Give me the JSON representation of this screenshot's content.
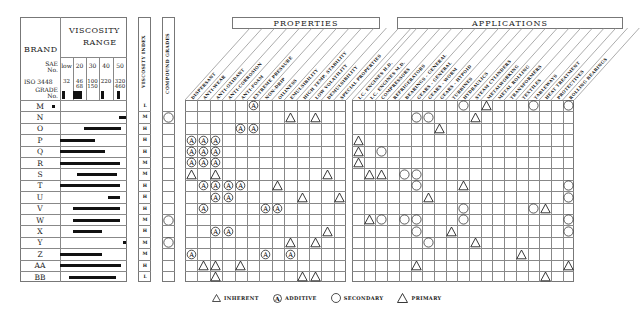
{
  "chart_data": {
    "type": "table",
    "left_panel": {
      "header": {
        "brand": "BRAND",
        "viscosity_range": [
          "VISCOSITY",
          "RANGE"
        ],
        "sae_label": [
          "SAE",
          "No."
        ],
        "iso_label": "ISO 3448",
        "grade_label": [
          "GRADE",
          "No."
        ],
        "sae_grades": [
          "low",
          "20",
          "30",
          "40",
          "50"
        ],
        "iso_grades": [
          "32",
          "46\n68",
          "100\n150",
          "220",
          "320\n460"
        ]
      },
      "viscosity_index_header": "VISCOSITY INDEX",
      "compound_grades_header": "COMPOUND GRADES"
    },
    "brands": [
      {
        "name": "M",
        "bar": [
          52,
          55
        ],
        "vi": "L",
        "compound": false
      },
      {
        "name": "N",
        "bar": [
          119,
          126
        ],
        "vi": "M",
        "compound": true
      },
      {
        "name": "O",
        "bar": [
          84,
          121
        ],
        "vi": "H",
        "compound": false
      },
      {
        "name": "P",
        "bar": [
          60,
          95
        ],
        "vi": "H",
        "compound": false
      },
      {
        "name": "Q",
        "bar": [
          60,
          105
        ],
        "vi": "H",
        "compound": false
      },
      {
        "name": "R",
        "bar": [
          60,
          120
        ],
        "vi": "M",
        "compound": false
      },
      {
        "name": "S",
        "bar": [
          77,
          117
        ],
        "vi": "M",
        "compound": false
      },
      {
        "name": "T",
        "bar": [
          60,
          120
        ],
        "vi": "H",
        "compound": false
      },
      {
        "name": "U",
        "bar": [
          108,
          120
        ],
        "vi": "H",
        "compound": false
      },
      {
        "name": "V",
        "bar": [
          73,
          120
        ],
        "vi": "H",
        "compound": false
      },
      {
        "name": "W",
        "bar": [
          73,
          120
        ],
        "vi": "M",
        "compound": true
      },
      {
        "name": "X",
        "bar": [
          73,
          102
        ],
        "vi": "H",
        "compound": false
      },
      {
        "name": "Y",
        "bar": [
          123,
          126
        ],
        "vi": "M",
        "compound": true
      },
      {
        "name": "Z",
        "bar": [
          60,
          102
        ],
        "vi": "M",
        "compound": false
      },
      {
        "name": "AA",
        "bar": [
          60,
          121
        ],
        "vi": "H",
        "compound": false
      },
      {
        "name": "BB",
        "bar": [
          69,
          116
        ],
        "vi": "L",
        "compound": false
      }
    ],
    "properties_header": "PROPERTIES",
    "properties_columns": [
      "DISPERSANT",
      "ANTI-WEAR",
      "ANTI-OXIDANT",
      "ANTI-CORROSION",
      "ANTI-FOAM",
      "EXTREME PRESSURE",
      "NON-DRIP",
      "OILINESS",
      "EMULSIBILITY",
      "HIGH TEMP. STABILITY",
      "LOW VOLATILITY",
      "DEMULSIBILITY",
      "SPECIAL PROPERTIES"
    ],
    "applications_header": "APPLICATIONS",
    "applications_columns": [
      "I.C. ENGINES H.D.",
      "I.C. ENGINES M.D.",
      "COMPRESSORS",
      "REFRIGERATORS",
      "BEARINGS - GENERAL",
      "GEARS - GENERAL",
      "GEARS - WORM",
      "GEARS - HYPOID",
      "TURBINES",
      "HYDRAULICS",
      "STEAM CYLINDERS",
      "METALWORKING",
      "METAL ROLLING",
      "TRANSFORMERS",
      "TEXTILES",
      "TABLEWAYS",
      "HEAT TREATMENT",
      "PROTECTIVES",
      "ROLLING BEARINGS"
    ],
    "legend": [
      {
        "symbol": "small-triangle",
        "label": "INHERENT"
      },
      {
        "symbol": "circled-a",
        "label": "ADDITIVE"
      },
      {
        "symbol": "circle",
        "label": "SECONDARY"
      },
      {
        "symbol": "triangle",
        "label": "PRIMARY"
      }
    ],
    "properties_marks": {
      "M": {
        "5": "A"
      },
      "N": {
        "8": "T",
        "10": "T"
      },
      "O": {
        "4": "A",
        "5": "A"
      },
      "P": {
        "0": "A",
        "1": "A",
        "2": "A"
      },
      "Q": {
        "0": "A",
        "1": "A",
        "2": "A"
      },
      "R": {
        "0": "A",
        "1": "A",
        "2": "A"
      },
      "S": {
        "0": "T",
        "2": "T",
        "11": "T"
      },
      "T": {
        "1": "A",
        "2": "A",
        "3": "A",
        "4": "A",
        "7": "T"
      },
      "U": {
        "2": "A",
        "3": "A",
        "9": "T",
        "12": "T"
      },
      "V": {
        "1": "A",
        "6": "A",
        "7": "A"
      },
      "W": {},
      "X": {
        "2": "A",
        "3": "A",
        "11": "T"
      },
      "Y": {
        "8": "T",
        "10": "T"
      },
      "Z": {
        "0": "A",
        "6": "A",
        "8": "A"
      },
      "AA": {
        "1": "T",
        "2": "T",
        "4": "T"
      },
      "BB": {
        "2": "T",
        "9": "T",
        "10": "T"
      }
    },
    "applications_marks": {
      "M": {
        "9": "C",
        "11": "T",
        "15": "C",
        "18": "C"
      },
      "N": {
        "5": "C",
        "6": "C",
        "10": "T"
      },
      "O": {
        "7": "T"
      },
      "P": {
        "0": "T"
      },
      "Q": {
        "0": "T",
        "2": "C"
      },
      "R": {
        "0": "T"
      },
      "S": {
        "1": "T",
        "2": "T",
        "4": "C",
        "5": "C"
      },
      "T": {
        "5": "C",
        "9": "T",
        "18": "C"
      },
      "U": {
        "6": "T",
        "18": "C"
      },
      "V": {
        "9": "C",
        "15": "C",
        "16": "T"
      },
      "W": {
        "1": "T",
        "2": "C",
        "4": "C",
        "5": "C",
        "9": "C",
        "18": "C"
      },
      "X": {
        "5": "C",
        "8": "T",
        "18": "C"
      },
      "Y": {
        "6": "C",
        "10": "T"
      },
      "Z": {
        "14": "T"
      },
      "AA": {
        "5": "T",
        "18": "T"
      },
      "BB": {
        "16": "T"
      }
    }
  }
}
